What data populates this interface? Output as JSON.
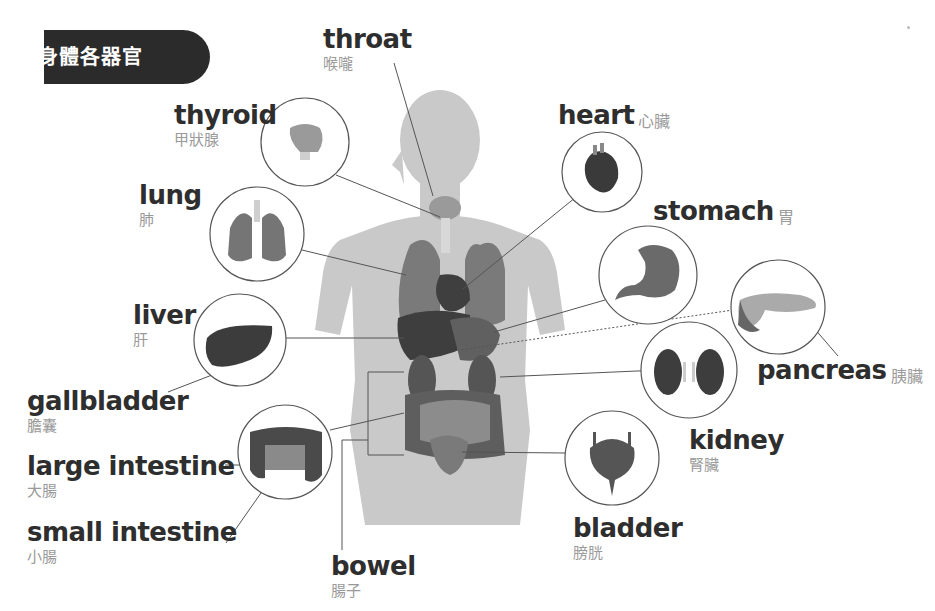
{
  "title": "身體各器官",
  "colors": {
    "banner_bg": "#2b2b2b",
    "label_en": "#2e2e2e",
    "label_zh": "#9a9a9a",
    "silhouette": "#c9c9c9",
    "organ_dark": "#4a4a4a",
    "organ_mid": "#6e6e6e",
    "leader_line": "#555555",
    "circle_stroke": "#555555"
  },
  "organs": {
    "throat": {
      "en": "throat",
      "zh": "喉嚨"
    },
    "thyroid": {
      "en": "thyroid",
      "zh": "甲狀腺"
    },
    "lung": {
      "en": "lung",
      "zh": "肺"
    },
    "liver": {
      "en": "liver",
      "zh": "肝"
    },
    "gallbladder": {
      "en": "gallbladder",
      "zh": "膽囊"
    },
    "large_intestine": {
      "en": "large intestine",
      "zh": "大腸"
    },
    "small_intestine": {
      "en": "small intestine",
      "zh": "小腸"
    },
    "bowel": {
      "en": "bowel",
      "zh": "腸子"
    },
    "heart": {
      "en": "heart",
      "zh": "心臟"
    },
    "stomach": {
      "en": "stomach",
      "zh": "胃"
    },
    "pancreas": {
      "en": "pancreas",
      "zh": "胰臟"
    },
    "kidney": {
      "en": "kidney",
      "zh": "腎臟"
    },
    "bladder": {
      "en": "bladder",
      "zh": "膀胱"
    }
  }
}
